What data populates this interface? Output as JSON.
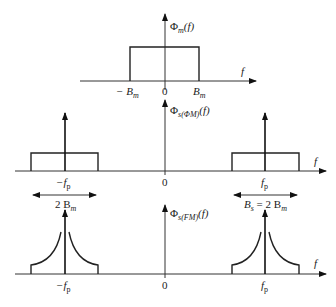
{
  "figure": {
    "panels": [
      {
        "id": "message-spectrum",
        "ylabel_main": "Φ",
        "ylabel_sub": "m",
        "ylabel_arg": "(f)",
        "xlabel": "f",
        "ticks": [
          {
            "label": "− B",
            "sub": "m"
          },
          {
            "label": "0",
            "sub": ""
          },
          {
            "label": "B",
            "sub": "m"
          }
        ],
        "shape": "rectangle"
      },
      {
        "id": "pm-spectrum",
        "ylabel_main": "Φ",
        "ylabel_sub": "s(ΦM)",
        "ylabel_arg": "(f)",
        "xlabel": "f",
        "ticks": [
          {
            "label": "−f",
            "sub": "p"
          },
          {
            "label": "0",
            "sub": ""
          },
          {
            "label": "f",
            "sub": "p"
          }
        ],
        "bandwidth_left": {
          "label": "2 B",
          "sub": "m"
        },
        "bandwidth_right": {
          "label": "B",
          "sub1": "s",
          "eq": " = 2 B",
          "sub2": "m"
        },
        "shape": "rectangle-with-carrier-impulses"
      },
      {
        "id": "fm-spectrum",
        "ylabel_main": "Φ",
        "ylabel_sub": "s(FM)",
        "ylabel_arg": "(f)",
        "xlabel": "f",
        "ticks": [
          {
            "label": "−f",
            "sub": "p"
          },
          {
            "label": "0",
            "sub": ""
          },
          {
            "label": "f",
            "sub": "p"
          }
        ],
        "shape": "cusp-with-carrier-impulses"
      }
    ]
  }
}
